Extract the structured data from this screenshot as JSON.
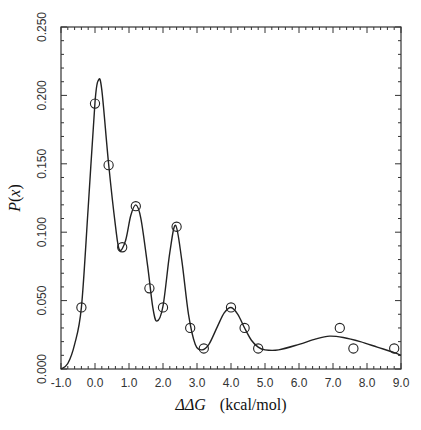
{
  "chart_data": {
    "type": "scatter",
    "title": "",
    "xlabel": "ΔΔG  (kcal/mol)",
    "xlabel_parts": {
      "symbol": "ΔΔG",
      "unit": "(kcal/mol)"
    },
    "ylabel": "P(x)",
    "ylabel_parts": {
      "func": "P",
      "open": "(",
      "var": "x",
      "close": ")"
    },
    "xlim": [
      -1.0,
      9.0
    ],
    "ylim": [
      0.0,
      0.25
    ],
    "x_ticks": [
      "-1.0",
      "0.0",
      "1.0",
      "2.0",
      "3.0",
      "4.0",
      "5.0",
      "6.0",
      "7.0",
      "8.0",
      "9.0"
    ],
    "x_tick_values": [
      -1,
      0,
      1,
      2,
      3,
      4,
      5,
      6,
      7,
      8,
      9
    ],
    "x_minor_step": 0.2,
    "y_ticks": [
      "0.000",
      "0.050",
      "0.100",
      "0.150",
      "0.200",
      "0.250"
    ],
    "y_tick_values": [
      0,
      0.05,
      0.1,
      0.15,
      0.2,
      0.25
    ],
    "y_minor_step": 0.01,
    "grid": false,
    "legend": null,
    "series": [
      {
        "name": "observed",
        "kind": "scatter",
        "marker": "open-circle",
        "x": [
          -0.4,
          0.0,
          0.4,
          0.8,
          1.2,
          1.6,
          2.0,
          2.4,
          2.8,
          3.2,
          4.0,
          4.4,
          4.8,
          7.2,
          7.6,
          8.8
        ],
        "y": [
          0.045,
          0.194,
          0.149,
          0.089,
          0.119,
          0.059,
          0.045,
          0.104,
          0.03,
          0.015,
          0.045,
          0.03,
          0.015,
          0.03,
          0.015,
          0.015
        ]
      },
      {
        "name": "fit",
        "kind": "line",
        "x": [
          -1.0,
          -0.8,
          -0.6,
          -0.4,
          -0.2,
          0.0,
          0.1,
          0.2,
          0.4,
          0.6,
          0.72,
          0.9,
          1.05,
          1.2,
          1.35,
          1.55,
          1.7,
          1.82,
          2.0,
          2.2,
          2.37,
          2.55,
          2.75,
          2.95,
          3.15,
          3.35,
          3.6,
          3.8,
          4.0,
          4.2,
          4.4,
          4.6,
          4.8,
          5.0,
          5.4,
          6.0,
          6.5,
          6.9,
          7.3,
          7.8,
          8.3,
          8.8,
          9.0
        ],
        "y": [
          0.0,
          0.004,
          0.018,
          0.045,
          0.118,
          0.195,
          0.211,
          0.204,
          0.15,
          0.105,
          0.087,
          0.094,
          0.112,
          0.12,
          0.11,
          0.075,
          0.045,
          0.035,
          0.046,
          0.085,
          0.105,
          0.08,
          0.04,
          0.018,
          0.014,
          0.018,
          0.031,
          0.041,
          0.045,
          0.04,
          0.03,
          0.021,
          0.016,
          0.014,
          0.014,
          0.018,
          0.022,
          0.024,
          0.023,
          0.02,
          0.016,
          0.012,
          0.01
        ]
      }
    ]
  }
}
